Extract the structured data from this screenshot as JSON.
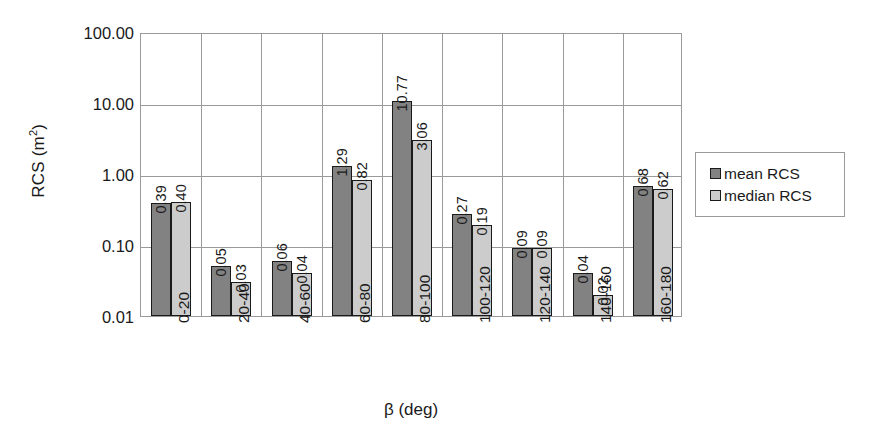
{
  "chart_data": {
    "type": "bar",
    "title": "",
    "xlabel": "β (deg)",
    "ylabel": "RCS (m²)",
    "yscale": "log",
    "ylim": [
      0.01,
      100.0
    ],
    "ytick_labels": [
      "100.00",
      "10.00",
      "1.00",
      "0.10",
      "0.01"
    ],
    "ytick_values": [
      100.0,
      10.0,
      1.0,
      0.1,
      0.01
    ],
    "grid": true,
    "legend_position": "right",
    "categories": [
      "0-20",
      "20-40",
      "40-60",
      "60-80",
      "80-100",
      "100-120",
      "120-140",
      "140-160",
      "160-180"
    ],
    "series": [
      {
        "name": "mean RCS",
        "color": "#828282",
        "values": [
          0.39,
          0.05,
          0.06,
          1.29,
          10.77,
          0.27,
          0.09,
          0.04,
          0.68
        ],
        "value_labels": [
          "0.39",
          "0.05",
          "0.06",
          "1.29",
          "10.77",
          "0.27",
          "0.09",
          "0.04",
          "0.68"
        ]
      },
      {
        "name": "median RCS",
        "color": "#cccccc",
        "values": [
          0.4,
          0.03,
          0.04,
          0.82,
          3.06,
          0.19,
          0.09,
          0.02,
          0.62
        ],
        "value_labels": [
          "0.40",
          "0.03",
          "0.04",
          "0.82",
          "3.06",
          "0.19",
          "0.09",
          "0.02",
          "0.62"
        ]
      }
    ]
  },
  "axes": {
    "y_title_main": "RCS (m",
    "y_title_sup": "2",
    "y_title_tail": ")",
    "x_title": "β (deg)"
  },
  "legend": {
    "items": [
      {
        "label": "mean RCS",
        "swatch": "mean"
      },
      {
        "label": "median RCS",
        "swatch": "median"
      }
    ]
  }
}
